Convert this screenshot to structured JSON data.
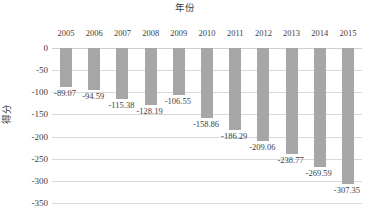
{
  "chart_data": {
    "type": "bar",
    "title": "年份",
    "xlabel": "年份",
    "ylabel": "得分",
    "categories": [
      "2005",
      "2006",
      "2007",
      "2008",
      "2009",
      "2010",
      "2011",
      "2012",
      "2013",
      "2014",
      "2015"
    ],
    "values": [
      -89.07,
      -94.59,
      -115.38,
      -128.19,
      -106.55,
      -158.86,
      -186.29,
      -209.06,
      -238.77,
      -269.59,
      -307.35
    ],
    "data_labels": [
      "-89.07",
      "-94.59",
      "-115.38",
      "-128.19",
      "-106.55",
      "-158.86",
      "-186.29",
      "-209.06",
      "-238.77",
      "-269.59",
      "-307.35"
    ],
    "ytick_labels": [
      "0",
      "-50",
      "-100",
      "-150",
      "-200",
      "-250",
      "-300",
      "-350"
    ],
    "ytick_values": [
      0,
      -50,
      -100,
      -150,
      -200,
      -250,
      -300,
      -350
    ],
    "ylim": [
      -350,
      0
    ],
    "grid": true,
    "legend": false,
    "bar_color": "#a6a6a6",
    "gridline_color": "#d9d9d9",
    "text_color": "#404040",
    "xaxis_position": "top",
    "series": [
      {
        "name": "得分",
        "values": [
          -89.07,
          -94.59,
          -115.38,
          -128.19,
          -106.55,
          -158.86,
          -186.29,
          -209.06,
          -238.77,
          -269.59,
          -307.35
        ]
      }
    ]
  }
}
